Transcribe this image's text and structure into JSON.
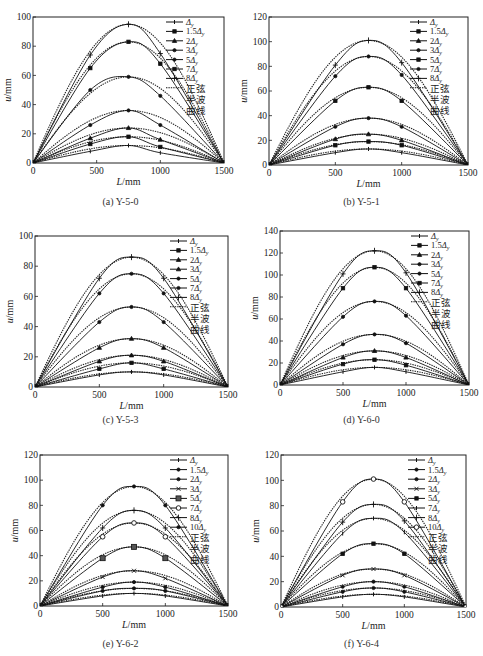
{
  "figure": {
    "panels": [
      {
        "id": "a",
        "caption": "(a) Y-5-0"
      },
      {
        "id": "b",
        "caption": "(b) Y-5-1"
      },
      {
        "id": "c",
        "caption": "(c) Y-5-3"
      },
      {
        "id": "d",
        "caption": "(d) Y-6-0"
      },
      {
        "id": "e",
        "caption": "(e) Y-6-2"
      },
      {
        "id": "f",
        "caption": "(f) Y-6-4"
      }
    ]
  },
  "chart_data": [
    {
      "type": "line",
      "id": "a",
      "title": "(a) Y-5-0",
      "xlabel": "L/mm",
      "ylabel": "u/mm",
      "xlim": [
        0,
        1500
      ],
      "ylim": [
        0,
        100
      ],
      "xticks": [
        0,
        500,
        1000,
        1500
      ],
      "yticks": [
        0,
        20,
        40,
        60,
        80,
        100
      ],
      "grid": false,
      "legend_position": "upper right",
      "x": [
        0,
        450,
        750,
        1000,
        1500
      ],
      "series": [
        {
          "name": "Δy",
          "marker": "bar",
          "values": [
            0,
            8,
            12,
            7,
            0
          ]
        },
        {
          "name": "1.5Δy",
          "marker": "square",
          "values": [
            0,
            13,
            18,
            11,
            0
          ]
        },
        {
          "name": "2Δy",
          "marker": "triangle",
          "values": [
            0,
            17,
            24,
            16,
            0
          ]
        },
        {
          "name": "3Δy",
          "marker": "dot",
          "values": [
            0,
            26,
            36,
            26,
            0
          ]
        },
        {
          "name": "5Δy",
          "marker": "dot",
          "values": [
            0,
            50,
            59,
            46,
            0
          ]
        },
        {
          "name": "7Δy",
          "marker": "square",
          "values": [
            0,
            65,
            83,
            68,
            0
          ]
        },
        {
          "name": "8Δy",
          "marker": "plus",
          "values": [
            0,
            74,
            95,
            75,
            0
          ]
        }
      ],
      "reference": {
        "name": "正弦半波曲线",
        "style": "dotted",
        "peaks": [
          12,
          18,
          24,
          36,
          59,
          83,
          95
        ]
      }
    },
    {
      "type": "line",
      "id": "b",
      "title": "(b) Y-5-1",
      "xlabel": "L/mm",
      "ylabel": "u/mm",
      "xlim": [
        0,
        1500
      ],
      "ylim": [
        0,
        120
      ],
      "xticks": [
        0,
        500,
        1000,
        1500
      ],
      "yticks": [
        0,
        20,
        40,
        60,
        80,
        100,
        120
      ],
      "grid": false,
      "legend_position": "upper right",
      "x": [
        0,
        500,
        750,
        1000,
        1500
      ],
      "series": [
        {
          "name": "Δy",
          "marker": "bar",
          "values": [
            0,
            10,
            13,
            10,
            0
          ]
        },
        {
          "name": "1.5Δy",
          "marker": "square",
          "values": [
            0,
            16,
            19,
            16,
            0
          ]
        },
        {
          "name": "2Δy",
          "marker": "triangle",
          "values": [
            0,
            21,
            25,
            20,
            0
          ]
        },
        {
          "name": "3Δy",
          "marker": "dot",
          "values": [
            0,
            31,
            38,
            31,
            0
          ]
        },
        {
          "name": "5Δy",
          "marker": "square",
          "values": [
            0,
            52,
            63,
            52,
            0
          ]
        },
        {
          "name": "7Δy",
          "marker": "dot",
          "values": [
            0,
            72,
            88,
            73,
            0
          ]
        },
        {
          "name": "8Δy",
          "marker": "plus",
          "values": [
            0,
            81,
            101,
            83,
            0
          ]
        }
      ],
      "reference": {
        "name": "正弦半波曲线",
        "style": "dotted",
        "peaks": [
          13,
          19,
          25,
          38,
          63,
          88,
          101
        ]
      }
    },
    {
      "type": "line",
      "id": "c",
      "title": "(c) Y-5-3",
      "xlabel": "L/mm",
      "ylabel": "u/mm",
      "xlim": [
        0,
        1500
      ],
      "ylim": [
        0,
        100
      ],
      "xticks": [
        0,
        500,
        1000,
        1500
      ],
      "yticks": [
        0,
        20,
        40,
        60,
        80,
        100
      ],
      "grid": false,
      "legend_position": "upper right",
      "x": [
        0,
        500,
        750,
        1000,
        1500
      ],
      "series": [
        {
          "name": "Δy",
          "marker": "bar",
          "values": [
            0,
            8,
            10,
            8,
            0
          ]
        },
        {
          "name": "1.5Δy",
          "marker": "square",
          "values": [
            0,
            12,
            16,
            12,
            0
          ]
        },
        {
          "name": "2Δy",
          "marker": "triangle",
          "values": [
            0,
            17,
            21,
            17,
            0
          ]
        },
        {
          "name": "3Δy",
          "marker": "triangle",
          "values": [
            0,
            26,
            32,
            26,
            0
          ]
        },
        {
          "name": "5Δy",
          "marker": "dot",
          "values": [
            0,
            43,
            53,
            43,
            0
          ]
        },
        {
          "name": "7Δy",
          "marker": "dot",
          "values": [
            0,
            62,
            75,
            62,
            0
          ]
        },
        {
          "name": "8Δy",
          "marker": "plus",
          "values": [
            0,
            72,
            86,
            72,
            0
          ]
        }
      ],
      "reference": {
        "name": "正弦半波曲线",
        "style": "dotted",
        "peaks": [
          10,
          16,
          21,
          32,
          53,
          75,
          86
        ]
      }
    },
    {
      "type": "line",
      "id": "d",
      "title": "(d) Y-6-0",
      "xlabel": "L/mm",
      "ylabel": "u/mm",
      "xlim": [
        0,
        1500
      ],
      "ylim": [
        0,
        140
      ],
      "xticks": [
        0,
        500,
        1000,
        1500
      ],
      "yticks": [
        0,
        20,
        40,
        60,
        80,
        100,
        120,
        140
      ],
      "grid": false,
      "legend_position": "upper right",
      "x": [
        0,
        500,
        750,
        1000,
        1500
      ],
      "series": [
        {
          "name": "Δy",
          "marker": "bar",
          "values": [
            0,
            12,
            16,
            12,
            0
          ]
        },
        {
          "name": "1.5Δy",
          "marker": "square",
          "values": [
            0,
            19,
            23,
            18,
            0
          ]
        },
        {
          "name": "2Δy",
          "marker": "triangle",
          "values": [
            0,
            25,
            31,
            25,
            0
          ]
        },
        {
          "name": "3Δy",
          "marker": "dot",
          "values": [
            0,
            37,
            46,
            38,
            0
          ]
        },
        {
          "name": "5Δy",
          "marker": "dot",
          "values": [
            0,
            62,
            76,
            63,
            0
          ]
        },
        {
          "name": "7Δy",
          "marker": "square",
          "values": [
            0,
            88,
            107,
            88,
            0
          ]
        },
        {
          "name": "8Δy",
          "marker": "plus",
          "values": [
            0,
            101,
            122,
            102,
            0
          ]
        }
      ],
      "reference": {
        "name": "正弦半波曲线",
        "style": "dotted",
        "peaks": [
          16,
          23,
          31,
          46,
          76,
          107,
          122
        ]
      }
    },
    {
      "type": "line",
      "id": "e",
      "title": "(e) Y-6-2",
      "xlabel": "L/mm",
      "ylabel": "u/mm",
      "xlim": [
        0,
        1500
      ],
      "ylim": [
        0,
        120
      ],
      "xticks": [
        0,
        500,
        1000,
        1500
      ],
      "yticks": [
        0,
        20,
        40,
        60,
        80,
        100,
        120
      ],
      "grid": false,
      "legend_position": "upper right",
      "x": [
        0,
        500,
        750,
        1000,
        1500
      ],
      "series": [
        {
          "name": "Δy",
          "marker": "bar",
          "values": [
            0,
            8,
            10,
            8,
            0
          ]
        },
        {
          "name": "1.5Δy",
          "marker": "dot",
          "values": [
            0,
            12,
            14,
            12,
            0
          ]
        },
        {
          "name": "2Δy",
          "marker": "dot",
          "values": [
            0,
            15,
            19,
            15,
            0
          ]
        },
        {
          "name": "3Δy",
          "marker": "x",
          "values": [
            0,
            23,
            28,
            22,
            0
          ]
        },
        {
          "name": "5Δy",
          "marker": "square-large",
          "values": [
            0,
            38,
            47,
            38,
            0
          ]
        },
        {
          "name": "7Δy",
          "marker": "circle-open",
          "values": [
            0,
            55,
            66,
            55,
            0
          ]
        },
        {
          "name": "8Δy",
          "marker": "plus",
          "values": [
            0,
            62,
            76,
            62,
            0
          ]
        },
        {
          "name": "10Δy",
          "marker": "dot",
          "values": [
            0,
            80,
            95,
            80,
            0
          ]
        }
      ],
      "reference": {
        "name": "正弦半波曲线",
        "style": "dotted",
        "peaks": [
          10,
          14,
          19,
          28,
          47,
          66,
          76,
          95
        ]
      }
    },
    {
      "type": "line",
      "id": "f",
      "title": "(f) Y-6-4",
      "xlabel": "L/mm",
      "ylabel": "u/mm",
      "xlim": [
        0,
        1500
      ],
      "ylim": [
        0,
        120
      ],
      "xticks": [
        0,
        500,
        1000,
        1500
      ],
      "yticks": [
        0,
        20,
        40,
        60,
        80,
        100,
        120
      ],
      "grid": false,
      "legend_position": "upper right",
      "x": [
        0,
        500,
        750,
        1000,
        1500
      ],
      "series": [
        {
          "name": "Δy",
          "marker": "bar",
          "values": [
            0,
            8,
            10,
            8,
            0
          ]
        },
        {
          "name": "1.5Δy",
          "marker": "dot",
          "values": [
            0,
            12,
            15,
            12,
            0
          ]
        },
        {
          "name": "2Δy",
          "marker": "dot",
          "values": [
            0,
            16,
            20,
            16,
            0
          ]
        },
        {
          "name": "3Δy",
          "marker": "x",
          "values": [
            0,
            25,
            30,
            25,
            0
          ]
        },
        {
          "name": "5Δy",
          "marker": "square",
          "values": [
            0,
            42,
            50,
            42,
            0
          ]
        },
        {
          "name": "7Δy",
          "marker": "bar",
          "values": [
            0,
            58,
            70,
            59,
            0
          ]
        },
        {
          "name": "8Δy",
          "marker": "plus",
          "values": [
            0,
            67,
            81,
            68,
            0
          ]
        },
        {
          "name": "10Δy",
          "marker": "circle-open",
          "values": [
            0,
            83,
            101,
            83,
            0
          ]
        }
      ],
      "reference": {
        "name": "正弦半波曲线",
        "style": "dotted",
        "peaks": [
          10,
          15,
          20,
          30,
          50,
          70,
          81,
          101
        ]
      }
    }
  ]
}
